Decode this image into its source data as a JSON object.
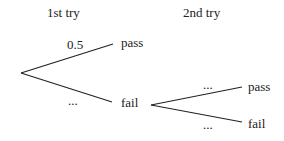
{
  "headers": {
    "first": "1st try",
    "second": "2nd try"
  },
  "tree": {
    "first_try": {
      "upper": {
        "outcome": "pass",
        "probability": "0.5"
      },
      "lower": {
        "outcome": "fail",
        "probability": "..."
      }
    },
    "second_try_after_fail": {
      "upper": {
        "outcome": "pass",
        "probability": "..."
      },
      "lower": {
        "outcome": "fail",
        "probability": "..."
      }
    }
  }
}
